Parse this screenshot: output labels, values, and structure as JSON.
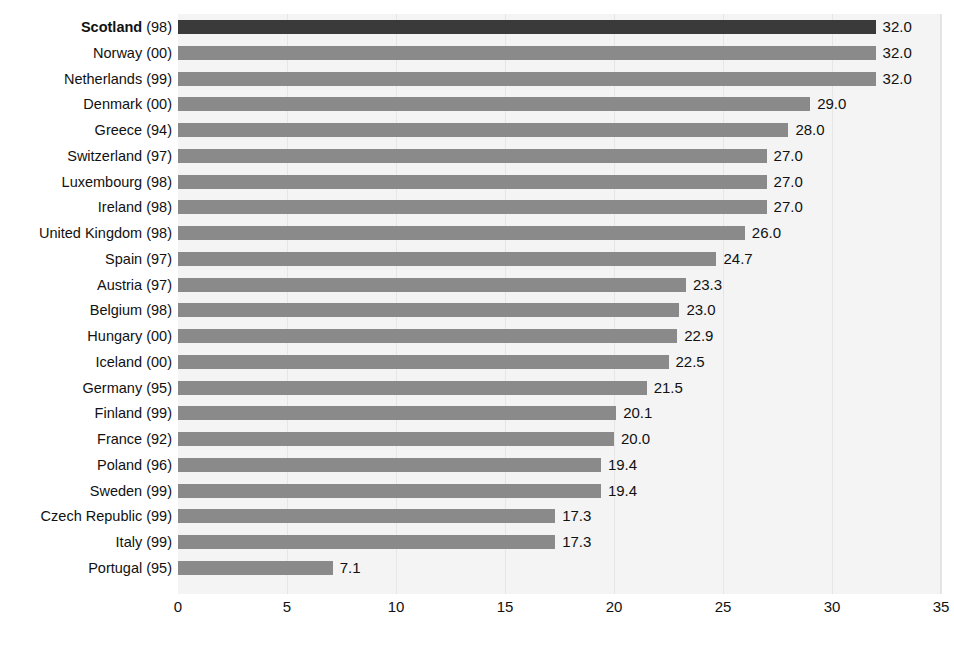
{
  "chart_data": {
    "type": "bar",
    "orientation": "horizontal",
    "title": "",
    "xlabel": "",
    "ylabel": "",
    "xlim": [
      0,
      35
    ],
    "xticks": [
      "0",
      "5",
      "10",
      "15",
      "20",
      "25",
      "30",
      "35"
    ],
    "grid": true,
    "legend": null,
    "highlight_category": "Scotland (98)",
    "categories": [
      "Scotland (98)",
      "Norway (00)",
      "Netherlands (99)",
      "Denmark (00)",
      "Greece (94)",
      "Switzerland (97)",
      "Luxembourg (98)",
      "Ireland (98)",
      "United Kingdom (98)",
      "Spain (97)",
      "Austria (97)",
      "Belgium (98)",
      "Hungary (00)",
      "Iceland (00)",
      "Germany (95)",
      "Finland (99)",
      "France (92)",
      "Poland (96)",
      "Sweden (99)",
      "Czech Republic (99)",
      "Italy (99)",
      "Portugal (95)"
    ],
    "values": [
      32.0,
      32.0,
      32.0,
      29.0,
      28.0,
      27.0,
      27.0,
      27.0,
      26.0,
      24.7,
      23.3,
      23.0,
      22.9,
      22.5,
      21.5,
      20.1,
      20.0,
      19.4,
      19.4,
      17.3,
      17.3,
      7.1
    ],
    "value_labels": [
      "32.0",
      "32.0",
      "32.0",
      "29.0",
      "28.0",
      "27.0",
      "27.0",
      "27.0",
      "26.0",
      "24.7",
      "23.3",
      "23.0",
      "22.9",
      "22.5",
      "21.5",
      "20.1",
      "20.0",
      "19.4",
      "19.4",
      "17.3",
      "17.3",
      "7.1"
    ],
    "rows": [
      {
        "country": "Scotland",
        "year": "(98)",
        "value": 32.0,
        "label": "32.0",
        "highlight": true
      },
      {
        "country": "Norway",
        "year": "(00)",
        "value": 32.0,
        "label": "32.0",
        "highlight": false
      },
      {
        "country": "Netherlands",
        "year": "(99)",
        "value": 32.0,
        "label": "32.0",
        "highlight": false
      },
      {
        "country": "Denmark",
        "year": "(00)",
        "value": 29.0,
        "label": "29.0",
        "highlight": false
      },
      {
        "country": "Greece",
        "year": "(94)",
        "value": 28.0,
        "label": "28.0",
        "highlight": false
      },
      {
        "country": "Switzerland",
        "year": "(97)",
        "value": 27.0,
        "label": "27.0",
        "highlight": false
      },
      {
        "country": "Luxembourg",
        "year": "(98)",
        "value": 27.0,
        "label": "27.0",
        "highlight": false
      },
      {
        "country": "Ireland",
        "year": "(98)",
        "value": 27.0,
        "label": "27.0",
        "highlight": false
      },
      {
        "country": "United Kingdom",
        "year": "(98)",
        "value": 26.0,
        "label": "26.0",
        "highlight": false
      },
      {
        "country": "Spain",
        "year": "(97)",
        "value": 24.7,
        "label": "24.7",
        "highlight": false
      },
      {
        "country": "Austria",
        "year": "(97)",
        "value": 23.3,
        "label": "23.3",
        "highlight": false
      },
      {
        "country": "Belgium",
        "year": "(98)",
        "value": 23.0,
        "label": "23.0",
        "highlight": false
      },
      {
        "country": "Hungary",
        "year": "(00)",
        "value": 22.9,
        "label": "22.9",
        "highlight": false
      },
      {
        "country": "Iceland",
        "year": "(00)",
        "value": 22.5,
        "label": "22.5",
        "highlight": false
      },
      {
        "country": "Germany",
        "year": "(95)",
        "value": 21.5,
        "label": "21.5",
        "highlight": false
      },
      {
        "country": "Finland",
        "year": "(99)",
        "value": 20.1,
        "label": "20.1",
        "highlight": false
      },
      {
        "country": "France",
        "year": "(92)",
        "value": 20.0,
        "label": "20.0",
        "highlight": false
      },
      {
        "country": "Poland",
        "year": "(96)",
        "value": 19.4,
        "label": "19.4",
        "highlight": false
      },
      {
        "country": "Sweden",
        "year": "(99)",
        "value": 19.4,
        "label": "19.4",
        "highlight": false
      },
      {
        "country": "Czech Republic",
        "year": "(99)",
        "value": 17.3,
        "label": "17.3",
        "highlight": false
      },
      {
        "country": "Italy",
        "year": "(99)",
        "value": 17.3,
        "label": "17.3",
        "highlight": false
      },
      {
        "country": "Portugal",
        "year": "(95)",
        "value": 7.1,
        "label": "7.1",
        "highlight": false
      }
    ]
  },
  "colors": {
    "bar": "#8a8a8a",
    "bar_highlight": "#3a3a3a",
    "plot_background": "#f4f4f4",
    "gridline": "#e6e6e6",
    "text": "#111111"
  }
}
